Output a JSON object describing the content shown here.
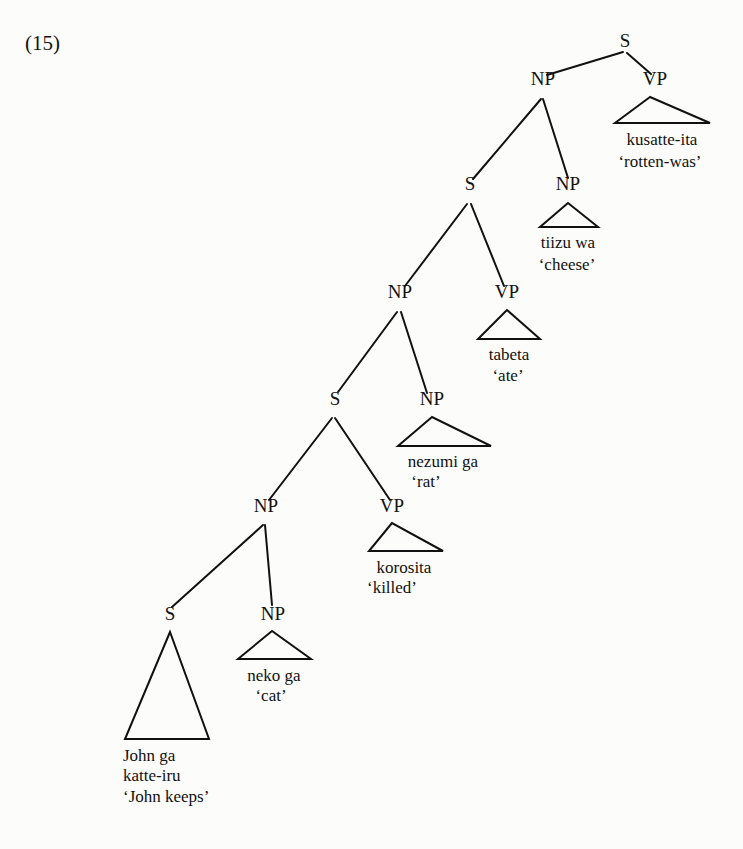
{
  "example_number": "(15)",
  "tree": {
    "nodes": [
      {
        "id": "s0",
        "label": "S",
        "x": 625,
        "y": 47
      },
      {
        "id": "np0",
        "label": "NP",
        "x": 543,
        "y": 85
      },
      {
        "id": "vp0",
        "label": "VP",
        "x": 655,
        "y": 85
      },
      {
        "id": "s1",
        "label": "S",
        "x": 470,
        "y": 190
      },
      {
        "id": "np1",
        "label": "NP",
        "x": 568,
        "y": 190
      },
      {
        "id": "np2",
        "label": "NP",
        "x": 400,
        "y": 298
      },
      {
        "id": "vp1",
        "label": "VP",
        "x": 507,
        "y": 298
      },
      {
        "id": "s2",
        "label": "S",
        "x": 335,
        "y": 405
      },
      {
        "id": "np3",
        "label": "NP",
        "x": 432,
        "y": 405
      },
      {
        "id": "np4",
        "label": "NP",
        "x": 266,
        "y": 512
      },
      {
        "id": "vp2",
        "label": "VP",
        "x": 392,
        "y": 512
      },
      {
        "id": "s3",
        "label": "S",
        "x": 170,
        "y": 620
      },
      {
        "id": "np5",
        "label": "NP",
        "x": 273,
        "y": 620
      }
    ],
    "edges": [
      {
        "from": "s0",
        "to": "np0",
        "x1": 623,
        "y1": 52,
        "x2": 547,
        "y2": 75
      },
      {
        "from": "s0",
        "to": "vp0",
        "x1": 627,
        "y1": 53,
        "x2": 651,
        "y2": 74
      },
      {
        "from": "np0",
        "to": "s1",
        "x1": 541,
        "y1": 99,
        "x2": 473,
        "y2": 179
      },
      {
        "from": "np0",
        "to": "np1",
        "x1": 543,
        "y1": 99,
        "x2": 568,
        "y2": 178
      },
      {
        "from": "s1",
        "to": "np2",
        "x1": 467,
        "y1": 204,
        "x2": 405,
        "y2": 286
      },
      {
        "from": "s1",
        "to": "vp1",
        "x1": 471,
        "y1": 204,
        "x2": 504,
        "y2": 286
      },
      {
        "from": "np2",
        "to": "s2",
        "x1": 397,
        "y1": 312,
        "x2": 338,
        "y2": 392
      },
      {
        "from": "np2",
        "to": "np3",
        "x1": 401,
        "y1": 312,
        "x2": 427,
        "y2": 393
      },
      {
        "from": "s2",
        "to": "np4",
        "x1": 332,
        "y1": 418,
        "x2": 269,
        "y2": 500
      },
      {
        "from": "s2",
        "to": "vp2",
        "x1": 335,
        "y1": 418,
        "x2": 390,
        "y2": 500
      },
      {
        "from": "np4",
        "to": "s3",
        "x1": 263,
        "y1": 525,
        "x2": 172,
        "y2": 607
      },
      {
        "from": "np4",
        "to": "np5",
        "x1": 265,
        "y1": 525,
        "x2": 272,
        "y2": 605
      }
    ],
    "triangles": [
      {
        "under": "vp0",
        "apex": [
          650,
          97
        ],
        "left": [
          615,
          123
        ],
        "right": [
          710,
          123
        ],
        "lines": [
          {
            "text": "kusatte-ita",
            "x": 662,
            "y": 145
          },
          {
            "text": "‘rotten-was’",
            "x": 660,
            "y": 167
          }
        ]
      },
      {
        "under": "np1",
        "apex": [
          568,
          203
        ],
        "left": [
          540,
          227
        ],
        "right": [
          598,
          227
        ],
        "lines": [
          {
            "text": "tiizu wa",
            "x": 568,
            "y": 248
          },
          {
            "text": "‘cheese’",
            "x": 567,
            "y": 270
          }
        ]
      },
      {
        "under": "vp1",
        "apex": [
          507,
          310
        ],
        "left": [
          478,
          339
        ],
        "right": [
          540,
          339
        ],
        "lines": [
          {
            "text": "tabeta",
            "x": 509,
            "y": 360
          },
          {
            "text": "‘ate’",
            "x": 508,
            "y": 381
          }
        ]
      },
      {
        "under": "np3",
        "apex": [
          432,
          417
        ],
        "left": [
          398,
          446
        ],
        "right": [
          491,
          446
        ],
        "lines": [
          {
            "text": "nezumi ga",
            "x": 443,
            "y": 467
          },
          {
            "text": "‘rat’",
            "x": 426,
            "y": 487
          }
        ]
      },
      {
        "under": "vp2",
        "apex": [
          392,
          523
        ],
        "left": [
          369,
          551
        ],
        "right": [
          443,
          551
        ],
        "lines": [
          {
            "text": "korosita",
            "x": 404,
            "y": 573
          },
          {
            "text": "‘killed’",
            "x": 392,
            "y": 593
          }
        ]
      },
      {
        "under": "np5",
        "apex": [
          272,
          631
        ],
        "left": [
          238,
          659
        ],
        "right": [
          311,
          659
        ],
        "lines": [
          {
            "text": "neko ga",
            "x": 274,
            "y": 681
          },
          {
            "text": "‘cat’",
            "x": 271,
            "y": 701
          }
        ]
      },
      {
        "under": "s3",
        "apex": [
          170,
          632
        ],
        "left": [
          125,
          739
        ],
        "right": [
          209,
          739
        ],
        "lines": [
          {
            "text": "John ga",
            "x": 123,
            "y": 761,
            "anchor": "start"
          },
          {
            "text": "katte-iru",
            "x": 123,
            "y": 781,
            "anchor": "start"
          },
          {
            "text": "‘John keeps’",
            "x": 123,
            "y": 802,
            "anchor": "start"
          }
        ]
      }
    ]
  }
}
